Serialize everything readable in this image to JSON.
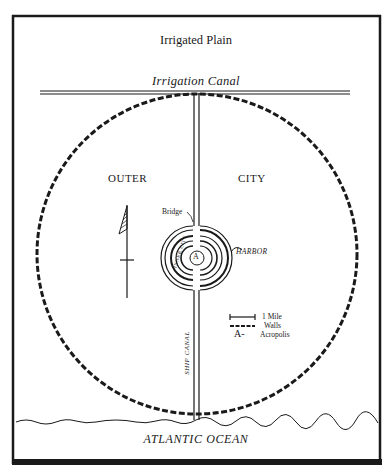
{
  "map": {
    "title": "Irrigated Plain",
    "canal_label": "Irrigation Canal",
    "regions": {
      "outer_left": "OUTER",
      "outer_right": "CITY",
      "inner_city": "INNER CITY"
    },
    "features": {
      "bridge": "Bridge",
      "harbor": "HARBOR",
      "acropolis_marker": "A",
      "ship_canal": "SHIP CANAL"
    },
    "legend": [
      {
        "symbol": "scale-bar",
        "label": "1 Mile"
      },
      {
        "symbol": "dashed-line",
        "label": "Walls"
      },
      {
        "symbol": "A-",
        "label": "Acropolis"
      }
    ],
    "ocean": "ATLANTIC OCEAN",
    "colors": {
      "ink": "#1a1a1a",
      "paper": "#ffffff"
    }
  }
}
